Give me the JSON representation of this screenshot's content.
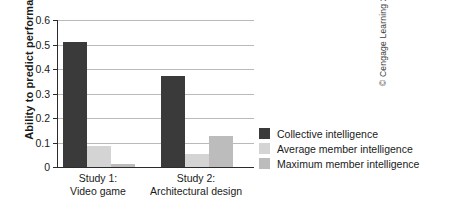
{
  "chart_data": {
    "type": "bar",
    "title": "",
    "xlabel": "",
    "ylabel": "Ability to predict performance",
    "ylim": [
      0,
      0.6
    ],
    "yticks": [
      "0",
      "0.1",
      "0.2",
      "0.3",
      "0.4",
      "0.5",
      "0.6"
    ],
    "ytick_values": [
      0,
      0.1,
      0.2,
      0.3,
      0.4,
      0.5,
      0.6
    ],
    "grid": true,
    "legend_position": "right",
    "categories": [
      "Study 1:\nVideo game",
      "Study 2:\nArchitectural design"
    ],
    "category_lines": [
      [
        "Study 1:",
        "Video game"
      ],
      [
        "Study 2:",
        "Architectural design"
      ]
    ],
    "series": [
      {
        "name": "Collective intelligence",
        "color": "#3a3a3a",
        "values": [
          0.51,
          0.37
        ]
      },
      {
        "name": "Average member intelligence",
        "color": "#d4d4d4",
        "values": [
          0.085,
          0.055
        ]
      },
      {
        "name": "Maximum member intelligence",
        "color": "#bcbcbc",
        "values": [
          0.012,
          0.125
        ]
      }
    ]
  },
  "legend": {
    "items": [
      {
        "label": "Collective intelligence",
        "color": "#3a3a3a"
      },
      {
        "label": "Average member intelligence",
        "color": "#d4d4d4"
      },
      {
        "label": "Maximum member intelligence",
        "color": "#bcbcbc"
      }
    ]
  },
  "credit": {
    "text": "© Cengage Learning 2013"
  }
}
